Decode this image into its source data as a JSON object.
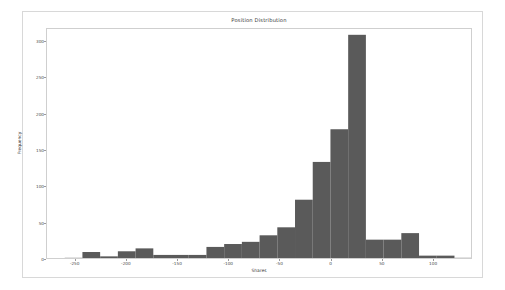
{
  "figure": {
    "background_color": "#ffffff",
    "border_color": "#d8d8d8",
    "axes_border_color": "#cfcfcf"
  },
  "chart_data": {
    "type": "bar",
    "subtype": "histogram",
    "title": "Position Distribution",
    "xlabel": "Shares",
    "ylabel": "Frequency",
    "bar_color": "#5a5a5a",
    "grid": false,
    "legend": null,
    "xlim": [
      -278,
      138
    ],
    "ylim": [
      0,
      318
    ],
    "xticks": [
      -250,
      -200,
      -150,
      -100,
      -50,
      0,
      50,
      100
    ],
    "xtick_labels": [
      "-250",
      "-200",
      "-150",
      "-100",
      "-50",
      "0",
      "50",
      "100"
    ],
    "yticks": [
      0,
      50,
      100,
      150,
      200,
      250,
      300
    ],
    "ytick_labels": [
      "0",
      "50",
      "100",
      "150",
      "200",
      "250",
      "300"
    ],
    "bin_width": 17.3,
    "bin_edges": [
      -278.0,
      -260.7,
      -243.4,
      -226.1,
      -208.8,
      -191.5,
      -174.2,
      -156.9,
      -139.6,
      -122.3,
      -105.0,
      -87.7,
      -70.4,
      -53.1,
      -35.8,
      -18.5,
      -1.2,
      16.1,
      33.4,
      50.7,
      68.0,
      85.3,
      102.6,
      119.9,
      137.2
    ],
    "categories": [
      "-278 to -261",
      "-261 to -243",
      "-243 to -226",
      "-226 to -209",
      "-209 to -191",
      "-191 to -174",
      "-174 to -157",
      "-157 to -140",
      "-140 to -122",
      "-122 to -105",
      "-105 to -88",
      "-88 to -70",
      "-70 to -53",
      "-53 to -36",
      "-36 to -18",
      "-18 to -1",
      "-1 to 16",
      "16 to 33",
      "33 to 51",
      "51 to 68",
      "68 to 85",
      "85 to 103",
      "103 to 120",
      "120 to 137"
    ],
    "values": [
      2,
      3,
      11,
      5,
      12,
      16,
      7,
      7,
      7,
      18,
      22,
      25,
      34,
      45,
      83,
      135,
      180,
      310,
      28,
      28,
      37,
      6,
      6,
      3
    ]
  }
}
